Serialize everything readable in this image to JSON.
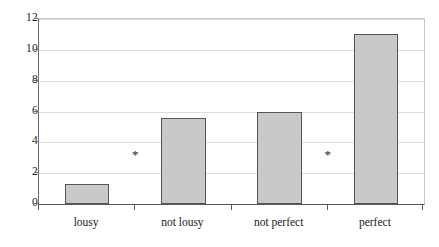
{
  "chart_data": {
    "type": "bar",
    "title": "",
    "subtitle": "",
    "xlabel": "",
    "ylabel": "",
    "categories": [
      "lousy",
      "not lousy",
      "not perfect",
      "perfect"
    ],
    "values": [
      1.3,
      5.6,
      6.0,
      11.0
    ],
    "ylim": [
      0,
      12
    ],
    "xlim": [
      0,
      4
    ],
    "yticks": [
      0,
      2,
      4,
      6,
      8,
      10,
      12
    ],
    "ytick_labels": [
      "0",
      "2",
      "4",
      "6",
      "8",
      "10",
      "12"
    ],
    "grid": "horizontal",
    "legend": "none",
    "bar_color": "#c9c9c9",
    "bar_edge_color": "#555555",
    "gridline_color": "#dcdcdc",
    "axis_color": "#5a5a5a",
    "annotations": [
      {
        "label": "*",
        "x": 1.0,
        "y": 3.2
      },
      {
        "label": "*",
        "x": 3.0,
        "y": 3.2
      }
    ]
  },
  "axis": {
    "y_ticks": [
      {
        "value": 12,
        "label": "12"
      },
      {
        "value": 10,
        "label": "10"
      },
      {
        "value": 8,
        "label": "8"
      },
      {
        "value": 6,
        "label": "6"
      },
      {
        "value": 4,
        "label": "4"
      },
      {
        "value": 2,
        "label": "2"
      },
      {
        "value": 0,
        "label": "0"
      }
    ],
    "x_ticks": [
      {
        "index": 0,
        "label": "lousy"
      },
      {
        "index": 1,
        "label": "not lousy"
      },
      {
        "index": 2,
        "label": "not perfect"
      },
      {
        "index": 3,
        "label": "perfect"
      }
    ]
  }
}
